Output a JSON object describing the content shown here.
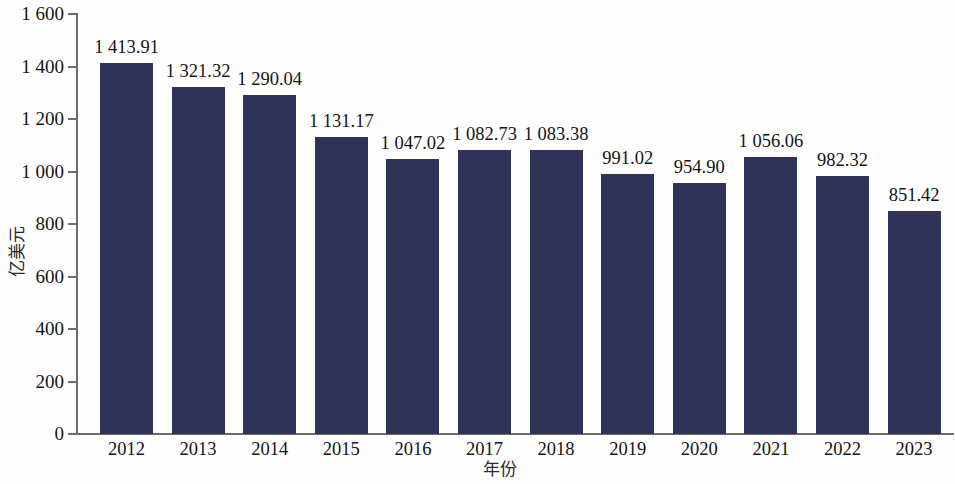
{
  "chart_data": {
    "type": "bar",
    "title": "",
    "subtitle": "",
    "xlabel": "年份",
    "ylabel": "亿美元",
    "categories": [
      "2012",
      "2013",
      "2014",
      "2015",
      "2016",
      "2017",
      "2018",
      "2019",
      "2020",
      "2021",
      "2022",
      "2023"
    ],
    "values": [
      1413.91,
      1321.32,
      1290.04,
      1131.17,
      1047.02,
      1082.73,
      1083.38,
      991.02,
      954.9,
      1056.06,
      982.32,
      851.42
    ],
    "value_labels": [
      "1 413.91",
      "1 321.32",
      "1 290.04",
      "1 131.17",
      "1 047.02",
      "1 082.73",
      "1 083.38",
      "991.02",
      "954.90",
      "1 056.06",
      "982.32",
      "851.42"
    ],
    "ylim": [
      0,
      1600
    ],
    "yticks": [
      0,
      200,
      400,
      600,
      800,
      1000,
      1200,
      1400,
      1600
    ],
    "ytick_labels": [
      "0",
      "200",
      "400",
      "600",
      "800",
      "1 000",
      "1 200",
      "1 400",
      "1 600"
    ],
    "grid": false,
    "legend": null,
    "series_color": "#303357",
    "axis_color": "#6d6d6d",
    "background_color": "#fefefe"
  }
}
